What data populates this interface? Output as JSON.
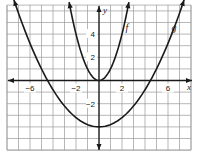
{
  "chart_data": {
    "type": "line",
    "title": "",
    "xlabel": "x",
    "ylabel": "y",
    "xlim": [
      -8,
      8
    ],
    "ylim": [
      -6,
      6.5
    ],
    "grid": true,
    "grid_step": 1,
    "x_tick_labels": [
      {
        "value": -6,
        "label": "−6"
      },
      {
        "value": -2,
        "label": "−2"
      },
      {
        "value": 2,
        "label": "2"
      },
      {
        "value": 6,
        "label": "6"
      }
    ],
    "y_tick_labels": [
      {
        "value": 4,
        "label": "4"
      },
      {
        "value": 2,
        "label": "2"
      },
      {
        "value": -2,
        "label": "−2"
      }
    ],
    "series": [
      {
        "name": "f",
        "equation": "y = x^2",
        "vertex": [
          0,
          0
        ],
        "x": [
          -2.6,
          -2,
          -1,
          0,
          1,
          2,
          2.6
        ],
        "values": [
          6.76,
          4,
          1,
          0,
          1,
          4,
          6.76
        ],
        "label_position": [
          2.3,
          4.3
        ]
      },
      {
        "name": "g",
        "equation": "y = x^2/5 - 4",
        "vertex": [
          0,
          -4
        ],
        "x_intercepts": [
          -4.47,
          4.47
        ],
        "x": [
          -7.4,
          -6,
          -4.47,
          -2,
          0,
          2,
          4.47,
          6,
          7.4
        ],
        "values": [
          6.95,
          3.2,
          0,
          -3.2,
          -4,
          -3.2,
          0,
          3.2,
          6.95
        ],
        "label_position": [
          6.3,
          4.3
        ]
      }
    ]
  },
  "labels": {
    "x_axis": "x",
    "y_axis": "y",
    "f": "f",
    "g": "g"
  }
}
